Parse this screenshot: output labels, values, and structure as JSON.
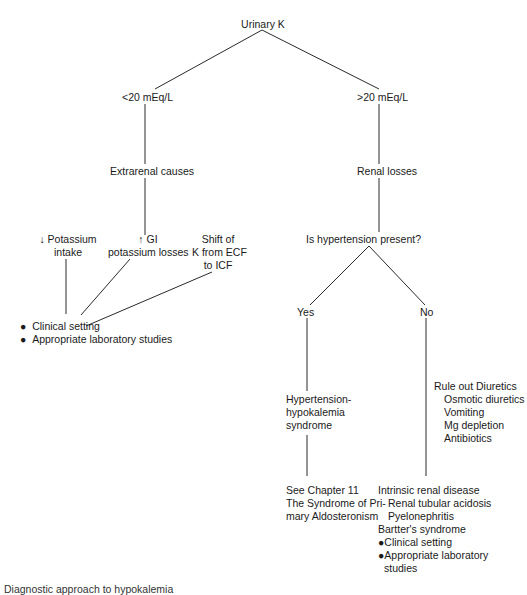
{
  "diagram": {
    "root": "Urinary K",
    "branches": {
      "low": "<20 mEq/L",
      "high": ">20 mEq/L"
    },
    "low_branch": {
      "category": "Extrarenal causes",
      "causes": [
        {
          "line1": "↓ Potassium",
          "line2": "intake"
        },
        {
          "line1": "↑ GI",
          "line2": "potassium losses"
        },
        {
          "line1": "Shift of",
          "line2": "K from ECF",
          "line3": "to ICF"
        }
      ],
      "workup": [
        "Clinical setting",
        "Appropriate laboratory studies"
      ]
    },
    "high_branch": {
      "category": "Renal losses",
      "question": "Is hypertension present?",
      "yes": {
        "label": "Yes",
        "result": [
          "Hypertension-",
          "hypokalemia",
          "syndrome"
        ],
        "reference": [
          "See Chapter 11",
          "The Syndrome of Pri-",
          "mary Aldosteronism"
        ]
      },
      "no": {
        "label": "No",
        "rule_out_title": "Rule out Diuretics",
        "rule_out_items": [
          "Osmotic diuretics",
          "Vomiting",
          "Mg depletion",
          "Antibiotics"
        ],
        "intrinsic_title": "Intrinsic renal disease",
        "intrinsic_items": [
          "Renal tubular acidosis",
          "Pyelonephritis"
        ],
        "bartter": "Bartter's syndrome",
        "workup": [
          "●Clinical setting",
          "●Appropriate laboratory",
          "studies"
        ]
      }
    },
    "caption": "Diagnostic approach to hypokalemia"
  }
}
